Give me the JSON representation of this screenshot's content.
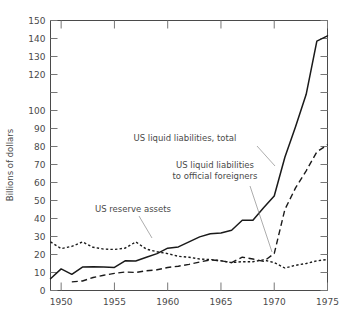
{
  "chart_data": {
    "type": "line",
    "title": "",
    "xlabel": "",
    "ylabel": "Billions of dollars",
    "xlim": [
      1949,
      1975
    ],
    "ylim": [
      0,
      150
    ],
    "grid": false,
    "legend_position": "inline-annotations",
    "x_ticks": [
      1950,
      1955,
      1960,
      1965,
      1970,
      1975
    ],
    "x_tick_labels": [
      "1950",
      "1955",
      "1960",
      "1965",
      "1970",
      "1975"
    ],
    "x_minor_ticks": [
      1951,
      1952,
      1953,
      1954,
      1956,
      1957,
      1958,
      1959,
      1961,
      1962,
      1963,
      1964,
      1966,
      1967,
      1968,
      1969,
      1971,
      1972,
      1973,
      1974
    ],
    "y_ticks": [
      0,
      10,
      20,
      30,
      40,
      50,
      60,
      70,
      80,
      90,
      100,
      110,
      120,
      130,
      140,
      150
    ],
    "y_tick_labels": [
      "0",
      "10",
      "20",
      "30",
      "40",
      "50",
      "60",
      "70",
      "80",
      "90",
      "100",
      "",
      "120",
      "130",
      "140",
      "150"
    ],
    "series": [
      {
        "name": "US liquid liabilities, total",
        "style": "solid",
        "color": "#1a1a1a",
        "x": [
          1949,
          1950,
          1951,
          1952,
          1953,
          1954,
          1955,
          1956,
          1957,
          1958,
          1959,
          1960,
          1961,
          1962,
          1963,
          1964,
          1965,
          1966,
          1967,
          1968,
          1969,
          1970,
          1971,
          1972,
          1973,
          1974,
          1975
        ],
        "values": [
          6.5,
          12.0,
          9.0,
          13.0,
          13.2,
          13.0,
          12.8,
          16.5,
          16.4,
          18.5,
          20.5,
          23.5,
          24.2,
          27.0,
          29.8,
          31.5,
          32.0,
          33.5,
          39.0,
          39.0,
          46.0,
          52.5,
          74.0,
          91.0,
          109.0,
          138.5,
          141.5
        ]
      },
      {
        "name": "US liquid liabilities to official foreigners",
        "style": "dashed",
        "color": "#1a1a1a",
        "x": [
          1951,
          1952,
          1953,
          1954,
          1955,
          1956,
          1957,
          1958,
          1959,
          1960,
          1961,
          1962,
          1963,
          1964,
          1965,
          1966,
          1967,
          1968,
          1969,
          1970,
          1971,
          1972,
          1973,
          1974,
          1975
        ],
        "values": [
          4.8,
          5.3,
          7.2,
          8.5,
          9.5,
          10.3,
          10.0,
          11.0,
          11.5,
          12.8,
          13.5,
          14.5,
          15.8,
          17.0,
          16.5,
          15.5,
          18.5,
          17.5,
          16.2,
          20.5,
          45.0,
          57.0,
          66.5,
          77.0,
          81.0
        ]
      },
      {
        "name": "US reserve assets",
        "style": "dotted",
        "color": "#1a1a1a",
        "x": [
          1949,
          1950,
          1951,
          1952,
          1953,
          1954,
          1955,
          1956,
          1957,
          1958,
          1959,
          1960,
          1961,
          1962,
          1963,
          1964,
          1965,
          1966,
          1967,
          1968,
          1969,
          1970,
          1971,
          1972,
          1973,
          1974,
          1975
        ],
        "values": [
          27.0,
          23.3,
          24.5,
          27.0,
          24.0,
          23.0,
          22.8,
          23.5,
          27.0,
          23.0,
          21.5,
          20.5,
          19.0,
          18.5,
          17.5,
          17.2,
          16.5,
          15.5,
          16.0,
          16.0,
          17.0,
          15.5,
          12.5,
          14.0,
          15.0,
          16.5,
          17.2
        ]
      }
    ],
    "annotations": [
      {
        "id": "annot-total",
        "text": "US liquid liabilities, total",
        "text_x": 185,
        "text_y": 141,
        "leader_from": [
          257,
          146
        ],
        "leader_to": [
          275,
          166
        ]
      },
      {
        "id": "annot-official",
        "text_line1": "US liquid liabilities",
        "text_line2": "to official foreigners",
        "text_x": 215,
        "text_y": 168,
        "leader_from": [
          250,
          186
        ],
        "leader_to": [
          272,
          252
        ]
      },
      {
        "id": "annot-reserve",
        "text": "US reserve assets",
        "text_x": 133,
        "text_y": 212,
        "leader_from": [
          139,
          216
        ],
        "leader_to": [
          152,
          238
        ]
      }
    ]
  }
}
